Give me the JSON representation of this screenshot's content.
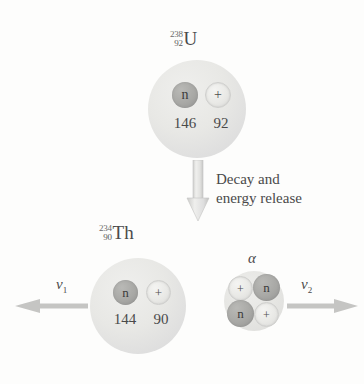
{
  "diagram": {
    "background_color": "#fdfdfc",
    "ink_color": "#4a4a4a"
  },
  "parent": {
    "label": {
      "mass_number": "238",
      "atomic_number": "92",
      "symbol": "U"
    },
    "neutron_glyph": "n",
    "proton_glyph": "+",
    "neutron_count": "146",
    "proton_count": "92"
  },
  "decay": {
    "line1": "Decay and",
    "line2": "energy release",
    "arrow_direction": "down"
  },
  "daughter": {
    "label": {
      "mass_number": "234",
      "atomic_number": "90",
      "symbol": "Th"
    },
    "neutron_glyph": "n",
    "proton_glyph": "+",
    "neutron_count": "144",
    "proton_count": "90"
  },
  "alpha": {
    "label": "α",
    "nucleons": [
      {
        "type": "proton",
        "glyph": "+"
      },
      {
        "type": "neutron",
        "glyph": "n"
      },
      {
        "type": "neutron",
        "glyph": "n"
      },
      {
        "type": "proton",
        "glyph": "+"
      }
    ]
  },
  "velocities": {
    "left": {
      "symbol": "v",
      "subscript": "1",
      "direction": "left"
    },
    "right": {
      "symbol": "v",
      "subscript": "2",
      "direction": "right"
    }
  }
}
